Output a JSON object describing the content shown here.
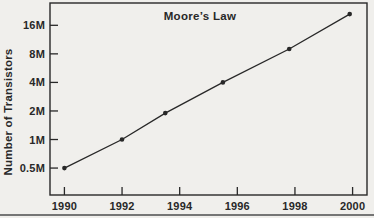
{
  "chart_data": {
    "type": "line",
    "title": "Moore’s Law",
    "xlabel": "",
    "ylabel": "Number of Transistors",
    "y_scale": "log2",
    "grid": false,
    "legend": "none",
    "x_range": [
      1989.5,
      2000.5
    ],
    "y_range_millions": [
      0.26,
      27.5
    ],
    "x_ticks": [
      {
        "year": 1990,
        "label": "1990"
      },
      {
        "year": 1992,
        "label": "1992"
      },
      {
        "year": 1994,
        "label": "1994"
      },
      {
        "year": 1996,
        "label": "1996"
      },
      {
        "year": 1998,
        "label": "1998"
      },
      {
        "year": 2000,
        "label": "2000"
      }
    ],
    "y_ticks": [
      {
        "value_millions": 16,
        "label": "16M"
      },
      {
        "value_millions": 8,
        "label": "8M"
      },
      {
        "value_millions": 4,
        "label": "4M"
      },
      {
        "value_millions": 2,
        "label": "2M"
      },
      {
        "value_millions": 1,
        "label": "1M"
      },
      {
        "value_millions": 0.5,
        "label": "0.5M"
      }
    ],
    "points": [
      {
        "year": 1990.0,
        "transistors_millions": 0.5
      },
      {
        "year": 1992.0,
        "transistors_millions": 1.0
      },
      {
        "year": 1993.5,
        "transistors_millions": 1.9
      },
      {
        "year": 1995.5,
        "transistors_millions": 4.0
      },
      {
        "year": 1997.8,
        "transistors_millions": 9.0
      },
      {
        "year": 1999.9,
        "transistors_millions": 21.0
      }
    ],
    "colors": {
      "ink": "#282828",
      "background": "#f0efec",
      "bottom_rule": "#757575"
    }
  }
}
